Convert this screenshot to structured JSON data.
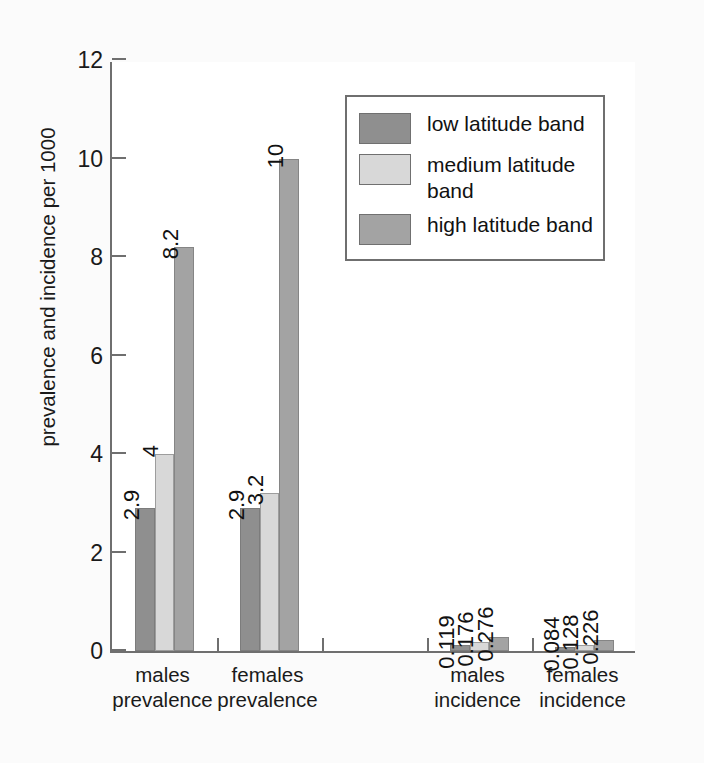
{
  "chart_data": {
    "type": "bar",
    "title": "",
    "xlabel": "",
    "ylabel": "prevalence and incidence per 1000",
    "ylim": [
      0,
      12
    ],
    "yticks": [
      0,
      2,
      4,
      6,
      8,
      10,
      12
    ],
    "ytick_labels": [
      "0",
      "2",
      "4",
      "6",
      "8",
      "10",
      "12"
    ],
    "grid": false,
    "legend_position": "upper right",
    "value_labels_rotated": true,
    "categories": [
      "males prevalence",
      "females prevalence",
      "",
      "males incidence",
      "females incidence"
    ],
    "category_lines": [
      [
        "males",
        "prevalence"
      ],
      [
        "females",
        "prevalence"
      ],
      [
        "",
        ""
      ],
      [
        "males",
        "incidence"
      ],
      [
        "females",
        "incidence"
      ]
    ],
    "series": [
      {
        "name": "low latitude band",
        "color": "#8f8f8f",
        "values": [
          2.9,
          2.9,
          null,
          0.119,
          0.084
        ],
        "labels": [
          "2.9",
          "2.9",
          "",
          "0.119",
          "0.084"
        ]
      },
      {
        "name": "medium latitude band",
        "color": "#d8d8d8",
        "values": [
          4,
          3.2,
          null,
          0.176,
          0.128
        ],
        "labels": [
          "4",
          "3.2",
          "",
          "0.176",
          "0.128"
        ]
      },
      {
        "name": "high latitude band",
        "color": "#a3a3a3",
        "values": [
          8.2,
          10,
          null,
          0.276,
          0.226
        ],
        "labels": [
          "8.2",
          "10",
          "",
          "0.276",
          "0.226"
        ]
      }
    ]
  },
  "legend": {
    "items": [
      {
        "label": "low latitude band",
        "color": "#8f8f8f"
      },
      {
        "label": "medium latitude band",
        "color": "#d8d8d8"
      },
      {
        "label": "high latitude band",
        "color": "#a3a3a3"
      }
    ]
  },
  "colors": {
    "axis": "#6f6f6f",
    "text": "#1a1a1a",
    "plot_background": "#ffffff",
    "figure_background": "#fbfbfb"
  }
}
